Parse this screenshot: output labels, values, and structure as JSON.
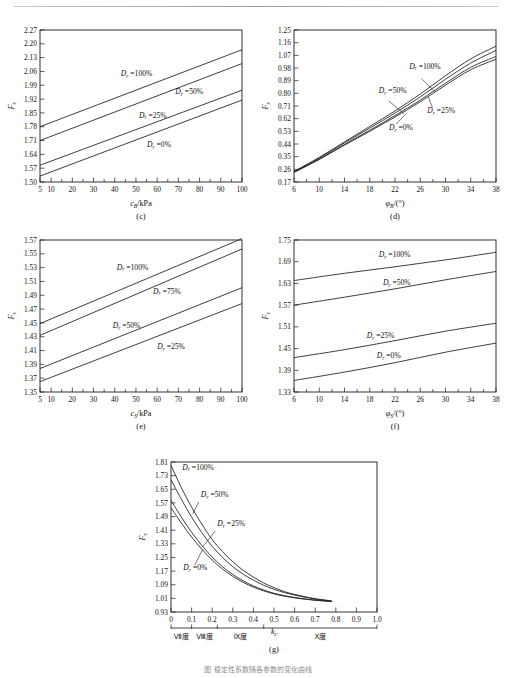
{
  "page": {
    "caption_partial": "图 稳定性系数随各参数的变化曲线"
  },
  "chart_data": [
    {
      "id": "c",
      "panel_label": "(c)",
      "type": "line",
      "title": "",
      "xlabel": "c_B/kPa",
      "xlabel_parts": {
        "sym": "c",
        "sub": "B",
        "rest": "/kPa"
      },
      "ylabel": "F_s",
      "ylabel_parts": {
        "sym": "F",
        "sub": "s"
      },
      "xlim": [
        5,
        100
      ],
      "ylim": [
        1.5,
        2.27
      ],
      "xticks": [
        5,
        10,
        20,
        30,
        40,
        50,
        60,
        70,
        80,
        90,
        100
      ],
      "xtick_labels": [
        "5",
        "10",
        "20",
        "30",
        "40",
        "50",
        "60",
        "70",
        "80",
        "90",
        "100"
      ],
      "yticks": [
        1.5,
        1.57,
        1.64,
        1.71,
        1.78,
        1.85,
        1.92,
        1.99,
        2.06,
        2.13,
        2.2,
        2.27
      ],
      "ytick_labels": [
        "1.50",
        "1.57",
        "1.64",
        "1.71",
        "1.78",
        "1.85",
        "1.92",
        "1.99",
        "2.06",
        "2.13",
        "2.20",
        "2.27"
      ],
      "grid": false,
      "legend": "inline-annotations",
      "series": [
        {
          "name": "Dr =100%",
          "label": "D_r =100%",
          "x": [
            5,
            100
          ],
          "values": [
            1.78,
            2.17
          ]
        },
        {
          "name": "Dr =50%",
          "label": "D_r =50%",
          "x": [
            5,
            100
          ],
          "values": [
            1.71,
            2.1
          ]
        },
        {
          "name": "Dr =25%",
          "label": "D_r =25%",
          "x": [
            5,
            100
          ],
          "values": [
            1.585,
            1.965
          ]
        },
        {
          "name": "Dr =0%",
          "label": "D_r =0%",
          "x": [
            5,
            100
          ],
          "values": [
            1.53,
            1.915
          ]
        }
      ]
    },
    {
      "id": "d",
      "panel_label": "(d)",
      "type": "line",
      "title": "",
      "xlabel": "φ_B/(°)",
      "xlabel_parts": {
        "sym": "φ",
        "sub": "B",
        "rest": "/(°)"
      },
      "ylabel": "F_s",
      "ylabel_parts": {
        "sym": "F",
        "sub": "s"
      },
      "xlim": [
        6,
        38
      ],
      "ylim": [
        0.17,
        1.25
      ],
      "xticks": [
        6,
        10,
        14,
        18,
        22,
        26,
        30,
        34,
        38
      ],
      "xtick_labels": [
        "6",
        "10",
        "14",
        "18",
        "22",
        "26",
        "30",
        "34",
        "38"
      ],
      "yticks": [
        0.17,
        0.26,
        0.35,
        0.44,
        0.53,
        0.62,
        0.71,
        0.8,
        0.89,
        0.98,
        1.07,
        1.16,
        1.25
      ],
      "ytick_labels": [
        "0.17",
        "0.26",
        "0.35",
        "0.44",
        "0.53",
        "0.62",
        "0.71",
        "0.80",
        "0.89",
        "0.98",
        "1.07",
        "1.16",
        "1.25"
      ],
      "grid": false,
      "legend": "inline-annotations",
      "series": [
        {
          "name": "Dr =100%",
          "label": "D_r =100%",
          "x": [
            6,
            10,
            14,
            18,
            22,
            26,
            30,
            34,
            38
          ],
          "values": [
            0.245,
            0.345,
            0.455,
            0.565,
            0.675,
            0.795,
            0.925,
            1.045,
            1.135
          ]
        },
        {
          "name": "Dr =50%",
          "label": "D_r =50%",
          "x": [
            6,
            10,
            14,
            18,
            22,
            26,
            30,
            34,
            38
          ],
          "values": [
            0.243,
            0.34,
            0.448,
            0.553,
            0.66,
            0.775,
            0.9,
            1.015,
            1.105
          ]
        },
        {
          "name": "Dr =25%",
          "label": "D_r =25%",
          "x": [
            6,
            10,
            14,
            18,
            22,
            26,
            30,
            34,
            38
          ],
          "values": [
            0.24,
            0.333,
            0.437,
            0.538,
            0.642,
            0.752,
            0.872,
            0.985,
            1.062
          ]
        },
        {
          "name": "Dr =0%",
          "label": "D_r =0%",
          "x": [
            6,
            10,
            14,
            18,
            22,
            26,
            30,
            34,
            38
          ],
          "values": [
            0.238,
            0.33,
            0.432,
            0.53,
            0.632,
            0.74,
            0.858,
            0.968,
            1.042
          ]
        }
      ]
    },
    {
      "id": "e",
      "panel_label": "(e)",
      "type": "line",
      "title": "",
      "xlabel": "c_S/kPa",
      "xlabel_parts": {
        "sym": "c",
        "sub": "S",
        "rest": "/kPa"
      },
      "ylabel": "F_s",
      "ylabel_parts": {
        "sym": "F",
        "sub": "s"
      },
      "xlim": [
        5,
        100
      ],
      "ylim": [
        1.35,
        1.57
      ],
      "xticks": [
        5,
        10,
        20,
        30,
        40,
        50,
        60,
        70,
        80,
        90,
        100
      ],
      "xtick_labels": [
        "5",
        "10",
        "20",
        "30",
        "40",
        "50",
        "60",
        "70",
        "80",
        "90",
        "100"
      ],
      "yticks": [
        1.35,
        1.37,
        1.39,
        1.41,
        1.43,
        1.45,
        1.47,
        1.49,
        1.51,
        1.53,
        1.55,
        1.57
      ],
      "ytick_labels": [
        "1.35",
        "1.37",
        "1.39",
        "1.41",
        "1.43",
        "1.45",
        "1.47",
        "1.49",
        "1.51",
        "1.53",
        "1.55",
        "1.57"
      ],
      "grid": false,
      "legend": "inline-annotations",
      "series": [
        {
          "name": "Dr =100%",
          "label": "D_r =100%",
          "x": [
            5,
            100
          ],
          "values": [
            1.449,
            1.572
          ]
        },
        {
          "name": "Dr =75%",
          "label": "D_r =75%",
          "x": [
            5,
            100
          ],
          "values": [
            1.432,
            1.557
          ]
        },
        {
          "name": "Dr =50%",
          "label": "D_r =50%",
          "x": [
            5,
            100
          ],
          "values": [
            1.384,
            1.501
          ]
        },
        {
          "name": "Dr =25%",
          "label": "D_r =25%",
          "x": [
            5,
            100
          ],
          "values": [
            1.365,
            1.478
          ]
        }
      ]
    },
    {
      "id": "f",
      "panel_label": "(f)",
      "type": "line",
      "title": "",
      "xlabel": "φ_S/(°)",
      "xlabel_parts": {
        "sym": "φ",
        "sub": "S",
        "rest": "/(°)"
      },
      "ylabel": "F_s",
      "ylabel_parts": {
        "sym": "F",
        "sub": "s"
      },
      "xlim": [
        6,
        38
      ],
      "ylim": [
        1.33,
        1.75
      ],
      "xticks": [
        6,
        10,
        14,
        18,
        22,
        26,
        30,
        34,
        38
      ],
      "xtick_labels": [
        "6",
        "10",
        "14",
        "18",
        "22",
        "26",
        "30",
        "34",
        "38"
      ],
      "yticks": [
        1.33,
        1.39,
        1.45,
        1.51,
        1.57,
        1.63,
        1.69,
        1.75
      ],
      "ytick_labels": [
        "1.33",
        "1.39",
        "1.45",
        "1.51",
        "1.57",
        "1.63",
        "1.69",
        "1.75"
      ],
      "grid": false,
      "legend": "inline-annotations",
      "series": [
        {
          "name": "Dr =100%",
          "label": "D_r =100%",
          "x": [
            6,
            14,
            22,
            30,
            38
          ],
          "values": [
            1.638,
            1.658,
            1.676,
            1.695,
            1.716
          ]
        },
        {
          "name": "Dr =50%",
          "label": "D_r =50%",
          "x": [
            6,
            14,
            22,
            30,
            38
          ],
          "values": [
            1.57,
            1.592,
            1.615,
            1.64,
            1.663
          ]
        },
        {
          "name": "Dr =25%",
          "label": "D_r =25%",
          "x": [
            6,
            14,
            22,
            30,
            38
          ],
          "values": [
            1.425,
            1.447,
            1.472,
            1.498,
            1.52
          ]
        },
        {
          "name": "Dr =0%",
          "label": "D_r =0%",
          "x": [
            6,
            14,
            22,
            30,
            38
          ],
          "values": [
            1.362,
            1.385,
            1.411,
            1.44,
            1.465
          ]
        }
      ]
    },
    {
      "id": "g",
      "panel_label": "(g)",
      "type": "line",
      "title": "",
      "xlabel": "k_c",
      "xlabel_parts": {
        "sym": "k",
        "sub": "c",
        "rest": ""
      },
      "ylabel": "F_s",
      "ylabel_parts": {
        "sym": "F",
        "sub": "s"
      },
      "xlim": [
        0,
        1.0
      ],
      "ylim": [
        0.93,
        1.81
      ],
      "xticks": [
        0,
        0.1,
        0.2,
        0.3,
        0.4,
        0.5,
        0.6,
        0.7,
        0.8,
        0.9,
        1.0
      ],
      "xtick_labels": [
        "0",
        "0.1",
        "0.2",
        "0.3",
        "0.4",
        "0.5",
        "0.6",
        "0.7",
        "0.8",
        "0.9",
        "1.0"
      ],
      "yticks": [
        0.93,
        1.01,
        1.09,
        1.17,
        1.25,
        1.33,
        1.41,
        1.49,
        1.57,
        1.65,
        1.73,
        1.81
      ],
      "ytick_labels": [
        "0.93",
        "1.01",
        "1.09",
        "1.17",
        "1.25",
        "1.33",
        "1.41",
        "1.49",
        "1.57",
        "1.65",
        "1.73",
        "1.81"
      ],
      "grid": false,
      "legend": "inline-annotations",
      "intensity_scale": [
        {
          "label": "Ⅶ度",
          "from": 0.0,
          "to": 0.1
        },
        {
          "label": "Ⅷ度",
          "from": 0.1,
          "to": 0.225
        },
        {
          "label": "Ⅸ度",
          "from": 0.225,
          "to": 0.45
        },
        {
          "label": "Ⅹ度",
          "from": 0.45,
          "to": 1.0
        }
      ],
      "series": [
        {
          "name": "Dr =100%",
          "label": "D_r =100%",
          "x": [
            0,
            0.05,
            0.1,
            0.15,
            0.2,
            0.25,
            0.3,
            0.35,
            0.4,
            0.45,
            0.5,
            0.55,
            0.6,
            0.65,
            0.7,
            0.78
          ],
          "values": [
            1.79,
            1.66,
            1.545,
            1.445,
            1.355,
            1.285,
            1.225,
            1.175,
            1.135,
            1.1,
            1.073,
            1.05,
            1.033,
            1.02,
            1.008,
            0.995
          ]
        },
        {
          "name": "Dr =50%",
          "label": "D_r =50%",
          "x": [
            0,
            0.05,
            0.1,
            0.15,
            0.2,
            0.25,
            0.3,
            0.35,
            0.4,
            0.45,
            0.5,
            0.55,
            0.6,
            0.65,
            0.7,
            0.78
          ],
          "values": [
            1.705,
            1.592,
            1.487,
            1.395,
            1.315,
            1.25,
            1.196,
            1.152,
            1.117,
            1.087,
            1.063,
            1.044,
            1.029,
            1.017,
            1.006,
            0.994
          ]
        },
        {
          "name": "Dr =25%",
          "label": "D_r =25%",
          "x": [
            0,
            0.05,
            0.1,
            0.15,
            0.2,
            0.25,
            0.3,
            0.35,
            0.4,
            0.45,
            0.5,
            0.55,
            0.6,
            0.65,
            0.7,
            0.78
          ],
          "values": [
            1.585,
            1.487,
            1.398,
            1.32,
            1.252,
            1.196,
            1.15,
            1.113,
            1.083,
            1.059,
            1.04,
            1.026,
            1.015,
            1.007,
            1.0,
            0.992
          ]
        },
        {
          "name": "Dr =0%",
          "label": "D_r =0%",
          "x": [
            0,
            0.05,
            0.1,
            0.15,
            0.2,
            0.25,
            0.3,
            0.35,
            0.4,
            0.45,
            0.5,
            0.55,
            0.6,
            0.65,
            0.7,
            0.78
          ],
          "values": [
            1.542,
            1.452,
            1.37,
            1.298,
            1.235,
            1.182,
            1.139,
            1.104,
            1.076,
            1.054,
            1.036,
            1.023,
            1.013,
            1.005,
            0.999,
            0.991
          ]
        }
      ]
    }
  ]
}
